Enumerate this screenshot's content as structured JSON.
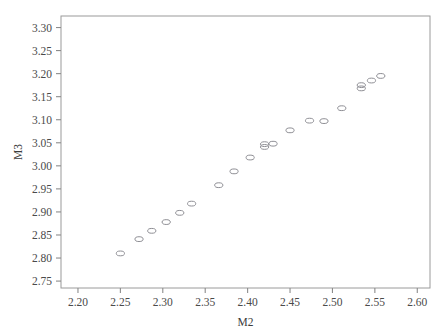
{
  "chart_data": {
    "type": "scatter",
    "title": "",
    "xlabel": "M2",
    "ylabel": "M3",
    "xlim": [
      2.18,
      2.615
    ],
    "ylim": [
      2.735,
      3.325
    ],
    "xticks": [
      "2.20",
      "2.25",
      "2.30",
      "2.35",
      "2.40",
      "2.45",
      "2.50",
      "2.55",
      "2.60"
    ],
    "xtick_values": [
      2.2,
      2.25,
      2.3,
      2.35,
      2.4,
      2.45,
      2.5,
      2.55,
      2.6
    ],
    "yticks": [
      "2.75",
      "2.80",
      "2.85",
      "2.90",
      "2.95",
      "3.00",
      "3.05",
      "3.10",
      "3.15",
      "3.20",
      "3.25",
      "3.30"
    ],
    "ytick_values": [
      2.75,
      2.8,
      2.85,
      2.9,
      2.95,
      3.0,
      3.05,
      3.1,
      3.15,
      3.2,
      3.25,
      3.3
    ],
    "grid": false,
    "legend": false,
    "marker_style": "open-ellipse",
    "series": [
      {
        "name": "M3 vs M2",
        "x": [
          2.25,
          2.272,
          2.287,
          2.304,
          2.32,
          2.334,
          2.366,
          2.384,
          2.403,
          2.42,
          2.42,
          2.43,
          2.45,
          2.473,
          2.49,
          2.511,
          2.534,
          2.534,
          2.546,
          2.557
        ],
        "y": [
          2.81,
          2.841,
          2.859,
          2.878,
          2.898,
          2.918,
          2.958,
          2.988,
          3.018,
          3.041,
          3.047,
          3.048,
          3.077,
          3.098,
          3.097,
          3.125,
          3.168,
          3.175,
          3.185,
          3.195
        ]
      }
    ],
    "n_points": 20
  },
  "axes": {
    "y_label": "M3",
    "x_label": "M2"
  }
}
